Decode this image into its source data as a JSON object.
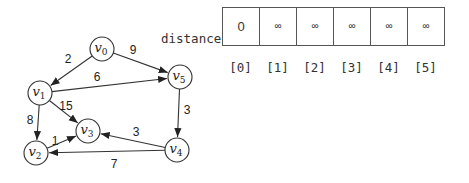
{
  "graph": {
    "nodes": [
      {
        "id": "v0",
        "base": "v",
        "sub": "0"
      },
      {
        "id": "v1",
        "base": "v",
        "sub": "1"
      },
      {
        "id": "v2",
        "base": "v",
        "sub": "2"
      },
      {
        "id": "v3",
        "base": "v",
        "sub": "3"
      },
      {
        "id": "v4",
        "base": "v",
        "sub": "4"
      },
      {
        "id": "v5",
        "base": "v",
        "sub": "5"
      }
    ],
    "edges": [
      {
        "from": "v0",
        "to": "v1",
        "weight": "2"
      },
      {
        "from": "v0",
        "to": "v5",
        "weight": "9"
      },
      {
        "from": "v1",
        "to": "v5",
        "weight": "6"
      },
      {
        "from": "v1",
        "to": "v3",
        "weight": "15"
      },
      {
        "from": "v1",
        "to": "v2",
        "weight": "8"
      },
      {
        "from": "v2",
        "to": "v3",
        "weight": "1"
      },
      {
        "from": "v5",
        "to": "v4",
        "weight": "3"
      },
      {
        "from": "v4",
        "to": "v3",
        "weight": "3"
      },
      {
        "from": "v4",
        "to": "v2",
        "weight": "7"
      }
    ]
  },
  "distance": {
    "label": "distance",
    "values": [
      "0",
      "∞",
      "∞",
      "∞",
      "∞",
      "∞"
    ],
    "indices": [
      "[0]",
      "[1]",
      "[2]",
      "[3]",
      "[4]",
      "[5]"
    ]
  }
}
